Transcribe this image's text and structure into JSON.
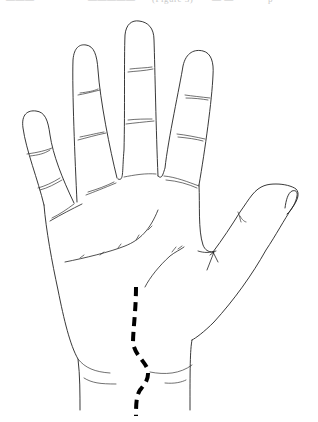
{
  "figure": {
    "caption_fragments": [
      {
        "text": "———",
        "x": 6
      },
      {
        "text": "—————",
        "x": 88
      },
      {
        "text": "(Figure 3)",
        "x": 152
      },
      {
        "text": "— —",
        "x": 212
      },
      {
        "text": "p",
        "x": 268
      }
    ],
    "highlight": {
      "description": "Bold dashed line running down the lower palm to the wrist",
      "color": "#000000"
    },
    "colors": {
      "background": "#ffffff",
      "outline": "#222222",
      "dashed_line": "#000000"
    }
  }
}
